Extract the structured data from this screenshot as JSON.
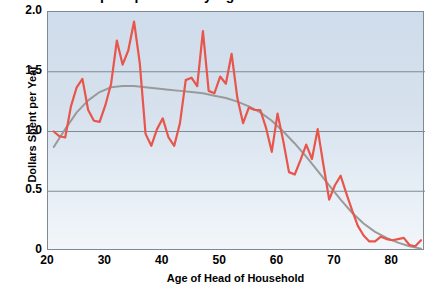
{
  "chart_data": {
    "type": "line",
    "title": "Dollars Spent per Year by Age of Head of Household",
    "xlabel": "Age of Head of Household",
    "ylabel": "Dollars Spent per Year",
    "xlim": [
      20,
      85.7
    ],
    "ylim": [
      0,
      2.0
    ],
    "xticks": [
      "20",
      "30",
      "40",
      "50",
      "60",
      "70",
      "80"
    ],
    "xtick_values": [
      20,
      30,
      40,
      50,
      60,
      70,
      80
    ],
    "yticks": [
      "0",
      "0.5",
      "1.0",
      "1.5",
      "2.0"
    ],
    "ytick_values": [
      0,
      0.5,
      1.0,
      1.5,
      2.0
    ],
    "grid": "horizontal",
    "gridlines_y": [
      0.5,
      1.0,
      1.5
    ],
    "legend": "none",
    "plot_background": "#d8e3ee",
    "series": [
      {
        "name": "Dollars Spent per Year",
        "kind": "observed",
        "color": "#e8554b",
        "linewidth": 2.2,
        "x": [
          21,
          22,
          23,
          24,
          25,
          26,
          27,
          28,
          29,
          30,
          31,
          32,
          33,
          34,
          35,
          36,
          37,
          38,
          39,
          40,
          41,
          42,
          43,
          44,
          45,
          46,
          47,
          48,
          49,
          50,
          51,
          52,
          53,
          54,
          55,
          56,
          57,
          58,
          59,
          60,
          61,
          62,
          63,
          64,
          65,
          66,
          67,
          68,
          69,
          70,
          71,
          72,
          73,
          74,
          75,
          76,
          77,
          78,
          79,
          80,
          81,
          82,
          83,
          84,
          85
        ],
        "y": [
          1.0,
          0.96,
          0.95,
          1.21,
          1.37,
          1.44,
          1.18,
          1.09,
          1.08,
          1.22,
          1.4,
          1.76,
          1.56,
          1.68,
          1.92,
          1.57,
          0.98,
          0.88,
          1.02,
          1.11,
          0.95,
          0.88,
          1.07,
          1.43,
          1.45,
          1.38,
          1.84,
          1.34,
          1.32,
          1.46,
          1.4,
          1.65,
          1.28,
          1.07,
          1.2,
          1.18,
          1.18,
          1.03,
          0.83,
          1.15,
          0.92,
          0.66,
          0.64,
          0.76,
          0.89,
          0.77,
          1.02,
          0.72,
          0.43,
          0.55,
          0.63,
          0.48,
          0.34,
          0.21,
          0.13,
          0.08,
          0.08,
          0.12,
          0.1,
          0.09,
          0.1,
          0.11,
          0.05,
          0.04,
          0.09
        ]
      },
      {
        "name": "Smoothed trend",
        "kind": "trend",
        "color": "#9a9a9a",
        "linewidth": 2.0,
        "x": [
          21,
          23,
          25,
          27,
          29,
          31,
          33,
          35,
          37,
          39,
          41,
          43,
          45,
          47,
          49,
          51,
          53,
          55,
          57,
          59,
          61,
          63,
          65,
          67,
          69,
          71,
          73,
          75,
          77,
          79,
          81,
          83,
          85
        ],
        "y": [
          0.87,
          1.02,
          1.16,
          1.26,
          1.33,
          1.37,
          1.38,
          1.38,
          1.37,
          1.36,
          1.35,
          1.34,
          1.33,
          1.32,
          1.3,
          1.28,
          1.25,
          1.21,
          1.16,
          1.09,
          1.0,
          0.9,
          0.79,
          0.67,
          0.55,
          0.43,
          0.32,
          0.23,
          0.16,
          0.11,
          0.07,
          0.04,
          0.02
        ]
      }
    ]
  }
}
